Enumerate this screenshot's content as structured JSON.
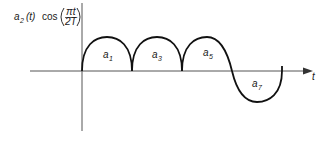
{
  "diagram": {
    "y_axis_label": {
      "prefix": "a",
      "prefix_sub": "2",
      "arg": "(t)",
      "func": "cos",
      "frac_num": "πt",
      "frac_den": "2T"
    },
    "x_axis_label": "t",
    "segments": [
      {
        "label": "a",
        "sub": "1",
        "shape": "positive-arch"
      },
      {
        "label": "a",
        "sub": "3",
        "shape": "positive-arch"
      },
      {
        "label": "a",
        "sub": "5",
        "shape": "positive-arch"
      },
      {
        "label": "a",
        "sub": "7",
        "shape": "negative-arch"
      }
    ],
    "colors": {
      "curve": "#111111",
      "axis": "#555555",
      "background": "#ffffff"
    }
  }
}
